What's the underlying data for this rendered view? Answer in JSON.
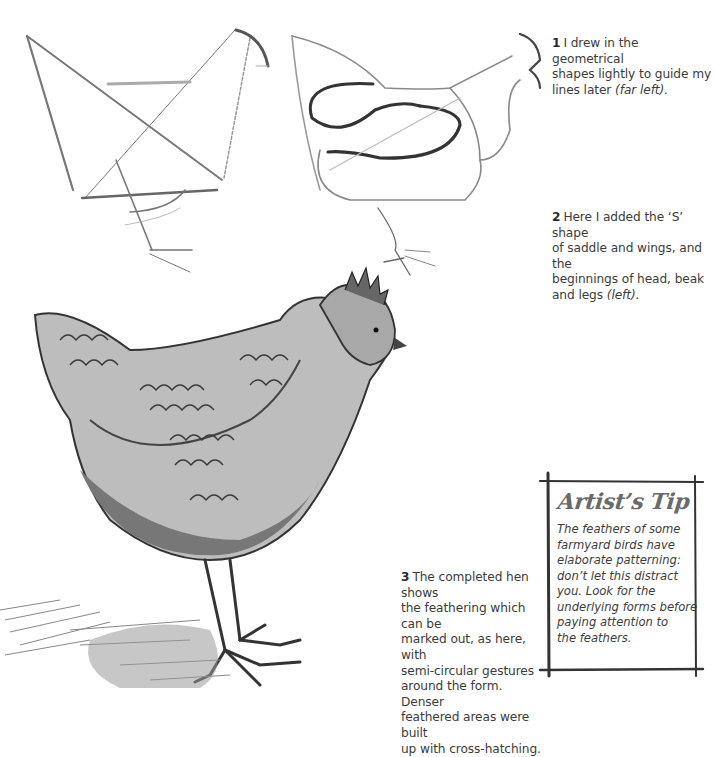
{
  "page": {
    "captions": [
      {
        "number": "1",
        "text": "I drew in the geometrical shapes lightly to guide my lines later",
        "ref": "(far left).",
        "lines": [
          "I drew in the geometrical",
          "shapes lightly to guide my",
          "lines later"
        ]
      },
      {
        "number": "2",
        "text": "Here I added the ‘S’ shape of saddle and wings, and the beginnings of head, beak and legs",
        "ref": "(left).",
        "lines": [
          "Here I added the ‘S’ shape",
          "of saddle and wings, and the",
          "beginnings of head, beak",
          "and legs"
        ]
      },
      {
        "number": "3",
        "lines": [
          "The completed hen shows",
          "the feathering which can be",
          "marked out, as here, with",
          "semi-circular gestures",
          "around the form. Denser",
          "feathered areas were built",
          "up with cross-hatching."
        ]
      }
    ],
    "artists_tip": {
      "title": "Artist’s Tip",
      "lines": [
        "The feathers of some",
        "farmyard birds have",
        "elaborate patterning:",
        "don’t let this distract",
        "you. Look for the",
        "underlying forms before",
        "paying attention to",
        "the feathers."
      ]
    },
    "illustrations": [
      {
        "id": "step-1-geometric-sketch",
        "description": "geometric guide shapes of a hen"
      },
      {
        "id": "step-2-s-shape-sketch",
        "description": "S shape of saddle and wings with head, beak and legs"
      },
      {
        "id": "step-3-completed-hen",
        "description": "completed cross-hatched hen drawing"
      }
    ]
  }
}
